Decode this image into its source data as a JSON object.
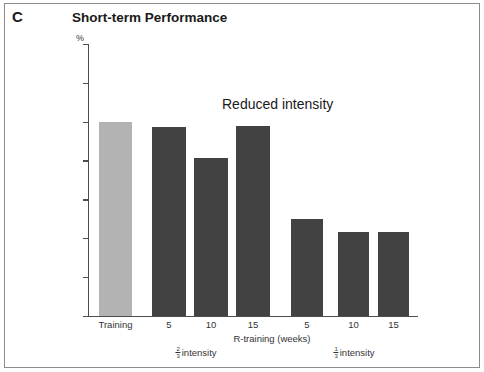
{
  "figure": {
    "panel_letter": "C",
    "title": "Short-term Performance",
    "annotation": "Reduced intensity",
    "unit": "%",
    "xaxis_title": "R-training (weeks)"
  },
  "groups": [
    {
      "label_prefix": "",
      "fraction_num": "2",
      "fraction_den": "3",
      "label_suffix": "intensity"
    },
    {
      "label_prefix": "",
      "fraction_num": "1",
      "fraction_den": "3",
      "label_suffix": "intensity"
    }
  ],
  "colors": {
    "training_bar": "#b3b3b3",
    "reduced_bar": "#424242",
    "axis": "#4d4d4d",
    "text": "#333333",
    "frame": "#8c8c8c",
    "background": "#ffffff"
  },
  "chart_data": {
    "type": "bar",
    "title": "Short-term Performance",
    "xlabel": "R-training (weeks)",
    "ylabel": "%",
    "ylim": [
      50,
      120
    ],
    "yticks": [
      50,
      60,
      70,
      80,
      90,
      100,
      110,
      120
    ],
    "grid": false,
    "legend": "none",
    "annotations": [
      "Reduced intensity"
    ],
    "categories": [
      "Training",
      "5",
      "10",
      "15",
      "5",
      "10",
      "15"
    ],
    "values": [
      100,
      98.5,
      90.5,
      99,
      75,
      71.5,
      71.5
    ],
    "bar_groups": [
      "Training",
      "2/3 intensity",
      "2/3 intensity",
      "2/3 intensity",
      "1/3 intensity",
      "1/3 intensity",
      "1/3 intensity"
    ],
    "bar_colors": [
      "#b3b3b3",
      "#424242",
      "#424242",
      "#424242",
      "#424242",
      "#424242",
      "#424242"
    ]
  }
}
